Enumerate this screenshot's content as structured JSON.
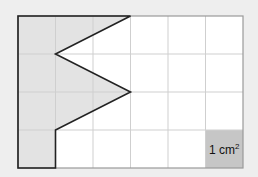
{
  "diagram": {
    "grid": {
      "columns": 6,
      "rows": 4,
      "unit": "cm"
    },
    "shape": {
      "description": "Shaded zigzag polygon",
      "vertices_grid_units": [
        [
          0,
          0
        ],
        [
          3,
          0
        ],
        [
          1,
          1
        ],
        [
          3,
          2
        ],
        [
          1,
          3
        ],
        [
          1,
          4
        ],
        [
          0,
          4
        ]
      ]
    },
    "unit_square": {
      "column": 5,
      "row": 3,
      "label_main": "1 cm",
      "label_sup": "2"
    },
    "colors": {
      "background": "#eeeeee",
      "grid_fill": "#ffffff",
      "grid_line": "#cfcfcf",
      "grid_border": "#9a9a9a",
      "shape_fill": "#e3e3e3",
      "shape_stroke": "#222222",
      "unit_square_fill": "#c6c6c6",
      "label_color": "#111111"
    }
  }
}
